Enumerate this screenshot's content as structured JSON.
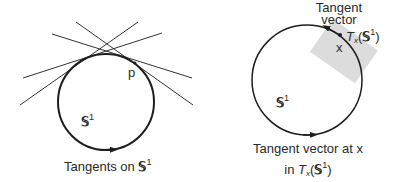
{
  "left_figure": {
    "caption_prefix": "Tangents on ",
    "manifold_symbol": "𝕊",
    "manifold_exponent": "1",
    "point_label": "p",
    "circle_label_symbol": "𝕊",
    "circle_label_exponent": "1",
    "circle": {
      "cx": 106,
      "cy": 102,
      "r": 48
    },
    "tangent_lines": [
      {
        "x1": 23,
        "y1": 78,
        "x2": 162,
        "y2": 33
      },
      {
        "x1": 20,
        "y1": 105,
        "x2": 138,
        "y2": 22
      },
      {
        "x1": 52,
        "y1": 34,
        "x2": 192,
        "y2": 78
      },
      {
        "x1": 76,
        "y1": 22,
        "x2": 193,
        "y2": 105
      }
    ]
  },
  "right_figure": {
    "vector_label_line1": "Tangent",
    "vector_label_line2": "vector",
    "point_label": "x",
    "space_label_T": "T",
    "space_label_sub": "x",
    "space_label_paren_open": "(",
    "space_label_symbol": "𝕊",
    "space_label_exponent": "1",
    "space_label_paren_close": ")",
    "circle_label_symbol": "𝕊",
    "circle_label_exponent": "1",
    "caption_line1": "Tangent vector at x",
    "caption_line2_prefix": "in ",
    "circle": {
      "cx": 307,
      "cy": 80,
      "r": 55
    },
    "tangent_plane_color": "#dcdcdc"
  },
  "colors": {
    "stroke": "#1e1e1e",
    "text": "#2a2a2a"
  }
}
